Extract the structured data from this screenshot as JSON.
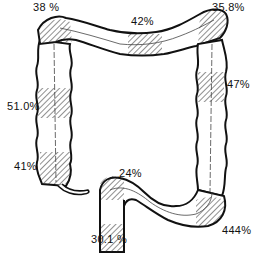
{
  "diagram": {
    "colors": {
      "ink": "#111111",
      "background": "#ffffff",
      "hatch": "#222222"
    },
    "labels": {
      "hepatic_upper_left": "38 %",
      "transverse_mid": "42%",
      "splenic_flexure": "35.8%",
      "descending_upper": "47%",
      "ascending_mid": "51.0%",
      "cecum": "41%",
      "sigmoid_top": "24%",
      "rectum": "30.1 %",
      "sigmoid_lower": "444%"
    }
  }
}
